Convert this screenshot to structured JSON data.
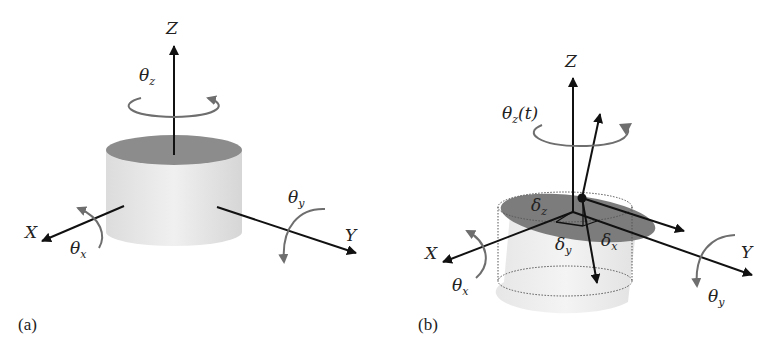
{
  "figure": {
    "panels": [
      {
        "id": "a",
        "label": "(a)",
        "description": "Rigid cylinder with three translational axes and three rotational degrees of freedom",
        "axes": {
          "z": "Z",
          "x": "X",
          "y": "Y"
        },
        "rotations": {
          "z": {
            "symbol": "θ",
            "subscript": "z"
          },
          "x": {
            "symbol": "θ",
            "subscript": "x"
          },
          "y": {
            "symbol": "θ",
            "subscript": "y"
          }
        }
      },
      {
        "id": "b",
        "label": "(b)",
        "description": "Displaced and rotated cylinder (dotted outline = original position) with translational offsets",
        "axes": {
          "z": "Z",
          "x": "X",
          "y": "Y"
        },
        "rotations": {
          "z": {
            "symbol": "θ",
            "subscript": "z",
            "suffix": "(t)"
          },
          "x": {
            "symbol": "θ",
            "subscript": "x"
          },
          "y": {
            "symbol": "θ",
            "subscript": "y"
          }
        },
        "displacements": {
          "z": {
            "symbol": "δ",
            "subscript": "z"
          },
          "y": {
            "symbol": "δ",
            "subscript": "y"
          },
          "x": {
            "symbol": "δ",
            "subscript": "x"
          }
        }
      }
    ],
    "colors": {
      "axis": "#111111",
      "rotation_arrow": "#6e6e6e",
      "cylinder_body": "#e6e6e6",
      "cylinder_top": "#8a8a8a",
      "displaced_top": "#7a7a7a",
      "dotted_outline": "#555555"
    }
  }
}
